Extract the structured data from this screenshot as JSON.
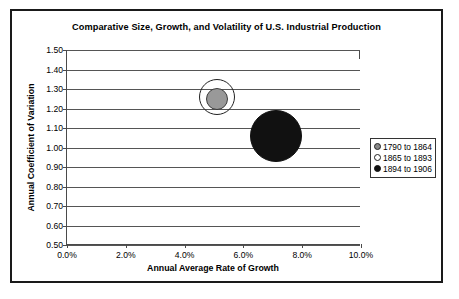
{
  "chart_data": {
    "type": "scatter",
    "title": "Comparative Size, Growth, and Volatility of U.S. Industrial Production",
    "xlabel": "Annual Average Rate of Growth",
    "ylabel": "Annual Coefficient of Variation",
    "xlim": [
      0.0,
      10.0
    ],
    "ylim": [
      0.5,
      1.5
    ],
    "x_tick_labels": [
      "0.0%",
      "2.0%",
      "4.0%",
      "6.0%",
      "8.0%",
      "10.0%"
    ],
    "x_ticks": [
      0.0,
      2.0,
      4.0,
      6.0,
      8.0,
      10.0
    ],
    "y_tick_labels": [
      "1.50",
      "1.40",
      "1.30",
      "1.20",
      "1.10",
      "1.00",
      "0.90",
      "0.80",
      "0.70",
      "0.60",
      "0.50"
    ],
    "y_ticks": [
      1.5,
      1.4,
      1.3,
      1.2,
      1.1,
      1.0,
      0.9,
      0.8,
      0.7,
      0.6,
      0.5
    ],
    "grid": "horizontal",
    "legend_position": "right",
    "series": [
      {
        "name": "1790 to 1864",
        "marker": "filled-gray",
        "color": "#999999",
        "x": 5.1,
        "y": 1.25,
        "size_radius_px": 11
      },
      {
        "name": "1865 to 1893",
        "marker": "hollow",
        "color": "#ffffff",
        "x": 5.1,
        "y": 1.26,
        "size_radius_px": 18
      },
      {
        "name": "1894 to 1906",
        "marker": "filled-black",
        "color": "#111111",
        "x": 7.1,
        "y": 1.06,
        "size_radius_px": 26
      }
    ]
  },
  "legend": {
    "items": [
      {
        "label": "1790 to 1864",
        "marker": "gray"
      },
      {
        "label": "1865 to 1893",
        "marker": "hollow"
      },
      {
        "label": "1894 to 1906",
        "marker": "black"
      }
    ]
  }
}
